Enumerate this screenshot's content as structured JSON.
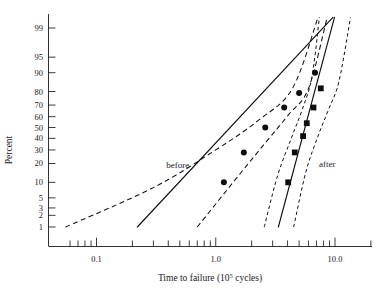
{
  "chart_data": {
    "type": "scatter",
    "title": "",
    "subtitle": "",
    "xlabel": "Time to failure (10⁵ cycles)",
    "ylabel": "Percent",
    "xlabel_base": "Time to failure (10",
    "xlabel_exp": "5",
    "xlabel_tail": " cycles)",
    "x_scale": "log",
    "y_scale": "probability",
    "xlim": [
      0.05,
      20
    ],
    "ylim": [
      1,
      99
    ],
    "grid": false,
    "legend_position": "inline-annotation",
    "x_ticks": [
      {
        "value": 0.1,
        "label": "0.1",
        "major": true
      },
      {
        "value": 1.0,
        "label": "1.0",
        "major": true
      },
      {
        "value": 10.0,
        "label": "10.0",
        "major": true
      }
    ],
    "x_minor_ticks": [
      0.06,
      0.07,
      0.08,
      0.09,
      0.2,
      0.3,
      0.4,
      0.5,
      0.6,
      0.7,
      0.8,
      0.9,
      2,
      3,
      4,
      5,
      6,
      7,
      8,
      9,
      20
    ],
    "y_ticks": [
      {
        "value": 1,
        "label": "1"
      },
      {
        "value": 2,
        "label": "2"
      },
      {
        "value": 3,
        "label": "3"
      },
      {
        "value": 5,
        "label": "5"
      },
      {
        "value": 10,
        "label": "10"
      },
      {
        "value": 20,
        "label": "20"
      },
      {
        "value": 30,
        "label": "30"
      },
      {
        "value": 40,
        "label": "40"
      },
      {
        "value": 50,
        "label": "50"
      },
      {
        "value": 60,
        "label": "60"
      },
      {
        "value": 70,
        "label": "70"
      },
      {
        "value": 80,
        "label": "80"
      },
      {
        "value": 90,
        "label": "90"
      },
      {
        "value": 95,
        "label": "95"
      },
      {
        "value": 99,
        "label": "99"
      }
    ],
    "series": [
      {
        "name": "before",
        "label": "before",
        "marker": "circle",
        "points": [
          {
            "x": 1.17,
            "y": 10
          },
          {
            "x": 1.72,
            "y": 28
          },
          {
            "x": 2.6,
            "y": 50
          },
          {
            "x": 3.75,
            "y": 68
          },
          {
            "x": 5.0,
            "y": 79
          },
          {
            "x": 6.8,
            "y": 90
          }
        ],
        "fit_line": {
          "x1": 0.22,
          "y1": 1.0,
          "x2": 9.6,
          "y2": 99.5
        },
        "ci_lower": [
          {
            "x": 0.055,
            "y": 1.0
          },
          {
            "x": 0.3,
            "y": 8
          },
          {
            "x": 1.0,
            "y": 30
          },
          {
            "x": 2.3,
            "y": 57
          },
          {
            "x": 4.4,
            "y": 82
          },
          {
            "x": 7.2,
            "y": 99.5
          }
        ],
        "ci_upper": [
          {
            "x": 0.7,
            "y": 1.0
          },
          {
            "x": 1.6,
            "y": 14
          },
          {
            "x": 2.7,
            "y": 38
          },
          {
            "x": 4.1,
            "y": 62
          },
          {
            "x": 6.0,
            "y": 82
          },
          {
            "x": 8.6,
            "y": 99.5
          }
        ]
      },
      {
        "name": "after",
        "label": "after",
        "marker": "square",
        "points": [
          {
            "x": 4.05,
            "y": 10
          },
          {
            "x": 4.6,
            "y": 28
          },
          {
            "x": 5.4,
            "y": 42
          },
          {
            "x": 5.8,
            "y": 54
          },
          {
            "x": 6.6,
            "y": 68
          },
          {
            "x": 7.6,
            "y": 82
          }
        ],
        "fit_line": {
          "x1": 3.35,
          "y1": 1.0,
          "x2": 9.9,
          "y2": 99.5
        },
        "ci_lower": [
          {
            "x": 2.55,
            "y": 1.0
          },
          {
            "x": 3.3,
            "y": 13
          },
          {
            "x": 4.3,
            "y": 40
          },
          {
            "x": 5.3,
            "y": 66
          },
          {
            "x": 6.4,
            "y": 88
          },
          {
            "x": 7.4,
            "y": 99.5
          }
        ],
        "ci_upper": [
          {
            "x": 4.5,
            "y": 1.0
          },
          {
            "x": 5.7,
            "y": 15
          },
          {
            "x": 7.2,
            "y": 42
          },
          {
            "x": 8.8,
            "y": 66
          },
          {
            "x": 10.8,
            "y": 86
          },
          {
            "x": 13.5,
            "y": 99.5
          }
        ]
      }
    ],
    "annotations": [
      {
        "text": "before",
        "x": 0.48,
        "y": 17
      },
      {
        "text": "after",
        "x": 8.6,
        "y": 18
      }
    ]
  }
}
